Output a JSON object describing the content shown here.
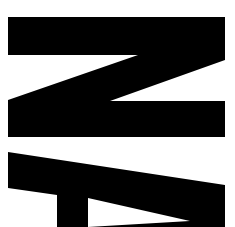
{
  "image": {
    "description": "Large black letterforms rotated 90 degrees: an 'N' (appearing as Z) above a partially cropped 'A'",
    "letters": [
      "N",
      "A"
    ],
    "colors": {
      "glyph": "#000000",
      "background": "#ffffff"
    }
  }
}
